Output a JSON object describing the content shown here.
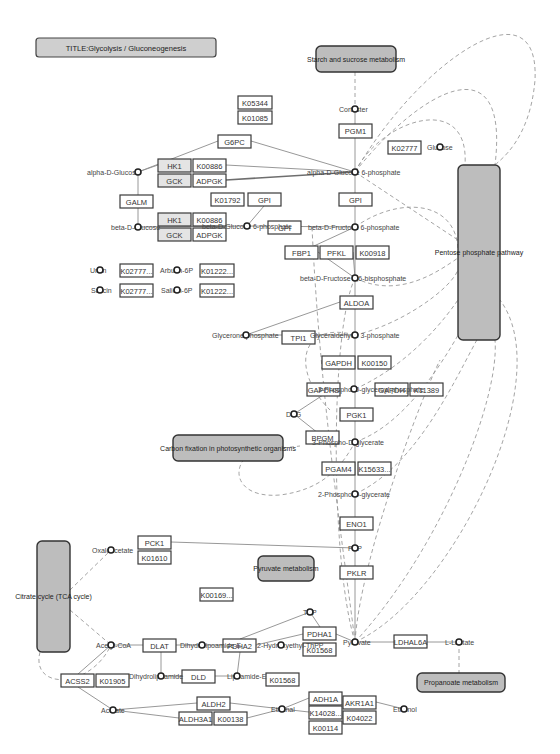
{
  "title": "TITLE:Glycolysis / Gluconeogenesis",
  "colors": {
    "map_fill": "#bdbdbd",
    "gene_border": "#3a3a3a",
    "edge": "#8c8c8c",
    "dashed": "#9a9a9a"
  },
  "maps": [
    {
      "id": "starch",
      "label": "Starch and sucrose metabolism",
      "x": 316,
      "y": 46,
      "w": 80,
      "h": 26
    },
    {
      "id": "ppp",
      "label": "Pentose phosphate pathway",
      "x": 458,
      "y": 165,
      "w": 42,
      "h": 175
    },
    {
      "id": "carbon",
      "label": "Carbon fixation in photosynthetic organisms",
      "x": 173,
      "y": 435,
      "w": 110,
      "h": 26
    },
    {
      "id": "pyruvate",
      "label": "Pyruvate metabolism",
      "x": 258,
      "y": 556,
      "w": 56,
      "h": 25
    },
    {
      "id": "tca",
      "label": "Citrate cycle (TCA cycle)",
      "x": 37,
      "y": 541,
      "w": 33,
      "h": 111
    },
    {
      "id": "propanoate",
      "label": "Propanoate metabolism",
      "x": 417,
      "y": 673,
      "w": 88,
      "h": 19
    }
  ],
  "genes": [
    {
      "label": "K05344",
      "x": 238,
      "y": 96,
      "w": 34,
      "h": 13
    },
    {
      "label": "K01085",
      "x": 238,
      "y": 111,
      "w": 34,
      "h": 13
    },
    {
      "label": "PGM1",
      "x": 339,
      "y": 124,
      "w": 33,
      "h": 14
    },
    {
      "label": "K02777",
      "x": 388,
      "y": 141,
      "w": 33,
      "h": 13
    },
    {
      "label": "G6PC",
      "x": 218,
      "y": 135,
      "w": 33,
      "h": 13
    },
    {
      "label": "HK1",
      "x": 158,
      "y": 159,
      "w": 33,
      "h": 13,
      "grey": true
    },
    {
      "label": "K00886",
      "x": 193,
      "y": 159,
      "w": 33,
      "h": 13
    },
    {
      "label": "GCK",
      "x": 158,
      "y": 174,
      "w": 33,
      "h": 13,
      "grey": true
    },
    {
      "label": "ADPGK",
      "x": 193,
      "y": 174,
      "w": 33,
      "h": 13
    },
    {
      "label": "GALM",
      "x": 120,
      "y": 195,
      "w": 33,
      "h": 13
    },
    {
      "label": "K01792",
      "x": 211,
      "y": 193,
      "w": 33,
      "h": 13
    },
    {
      "label": "GPI",
      "x": 248,
      "y": 193,
      "w": 33,
      "h": 13
    },
    {
      "label": "GPI",
      "x": 339,
      "y": 193,
      "w": 33,
      "h": 13
    },
    {
      "label": "HK1",
      "x": 158,
      "y": 213,
      "w": 33,
      "h": 13,
      "grey": true
    },
    {
      "label": "K00886",
      "x": 193,
      "y": 213,
      "w": 33,
      "h": 13
    },
    {
      "label": "GCK",
      "x": 158,
      "y": 228,
      "w": 33,
      "h": 13,
      "grey": true
    },
    {
      "label": "ADPGK",
      "x": 193,
      "y": 228,
      "w": 33,
      "h": 13
    },
    {
      "label": "GPI",
      "x": 268,
      "y": 221,
      "w": 33,
      "h": 13
    },
    {
      "label": "FBP1",
      "x": 285,
      "y": 246,
      "w": 33,
      "h": 13
    },
    {
      "label": "PFKL",
      "x": 320,
      "y": 246,
      "w": 33,
      "h": 13
    },
    {
      "label": "K00918",
      "x": 356,
      "y": 246,
      "w": 33,
      "h": 13
    },
    {
      "label": "K02777...",
      "x": 120,
      "y": 264,
      "w": 33,
      "h": 13
    },
    {
      "label": "K01222...",
      "x": 200,
      "y": 264,
      "w": 34,
      "h": 13
    },
    {
      "label": "K02777...",
      "x": 120,
      "y": 284,
      "w": 33,
      "h": 13
    },
    {
      "label": "K01222...",
      "x": 200,
      "y": 284,
      "w": 34,
      "h": 13
    },
    {
      "label": "ALDOA",
      "x": 340,
      "y": 296,
      "w": 33,
      "h": 13
    },
    {
      "label": "TPI1",
      "x": 282,
      "y": 331,
      "w": 33,
      "h": 13
    },
    {
      "label": "GAPDH",
      "x": 322,
      "y": 356,
      "w": 33,
      "h": 13
    },
    {
      "label": "K00150",
      "x": 358,
      "y": 356,
      "w": 33,
      "h": 13
    },
    {
      "label": "GAPDHS",
      "x": 307,
      "y": 383,
      "w": 33,
      "h": 13
    },
    {
      "label": "GAPDH",
      "x": 375,
      "y": 383,
      "w": 33,
      "h": 13
    },
    {
      "label": "K11389",
      "x": 410,
      "y": 383,
      "w": 33,
      "h": 13
    },
    {
      "label": "PGK1",
      "x": 340,
      "y": 408,
      "w": 33,
      "h": 13
    },
    {
      "label": "BPGM",
      "x": 306,
      "y": 431,
      "w": 33,
      "h": 13
    },
    {
      "label": "PGAM4",
      "x": 322,
      "y": 462,
      "w": 33,
      "h": 13
    },
    {
      "label": "K15633...",
      "x": 358,
      "y": 462,
      "w": 33,
      "h": 13
    },
    {
      "label": "ENO1",
      "x": 340,
      "y": 517,
      "w": 33,
      "h": 13
    },
    {
      "label": "PCK1",
      "x": 138,
      "y": 536,
      "w": 33,
      "h": 13
    },
    {
      "label": "K01610",
      "x": 138,
      "y": 551,
      "w": 33,
      "h": 13
    },
    {
      "label": "PKLR",
      "x": 340,
      "y": 566,
      "w": 33,
      "h": 13
    },
    {
      "label": "K00169...",
      "x": 200,
      "y": 588,
      "w": 33,
      "h": 13
    },
    {
      "label": "PDHA1",
      "x": 303,
      "y": 627,
      "w": 33,
      "h": 13
    },
    {
      "label": "K01568",
      "x": 303,
      "y": 643,
      "w": 33,
      "h": 13
    },
    {
      "label": "DLAT",
      "x": 143,
      "y": 639,
      "w": 33,
      "h": 13
    },
    {
      "label": "PDHA2",
      "x": 223,
      "y": 639,
      "w": 33,
      "h": 13
    },
    {
      "label": "LDHAL6A",
      "x": 394,
      "y": 635,
      "w": 33,
      "h": 13
    },
    {
      "label": "DLD",
      "x": 182,
      "y": 670,
      "w": 33,
      "h": 13
    },
    {
      "label": "ACSS2",
      "x": 61,
      "y": 674,
      "w": 33,
      "h": 13
    },
    {
      "label": "K01905",
      "x": 96,
      "y": 674,
      "w": 33,
      "h": 13
    },
    {
      "label": "K01568",
      "x": 266,
      "y": 673,
      "w": 33,
      "h": 13
    },
    {
      "label": "ADH1A",
      "x": 309,
      "y": 692,
      "w": 33,
      "h": 13
    },
    {
      "label": "K14028...",
      "x": 309,
      "y": 706,
      "w": 33,
      "h": 13
    },
    {
      "label": "K00114",
      "x": 309,
      "y": 721,
      "w": 33,
      "h": 13
    },
    {
      "label": "AKR1A1",
      "x": 343,
      "y": 696,
      "w": 33,
      "h": 13
    },
    {
      "label": "K04022",
      "x": 343,
      "y": 711,
      "w": 33,
      "h": 13
    },
    {
      "label": "ALDH2",
      "x": 197,
      "y": 697,
      "w": 33,
      "h": 13
    },
    {
      "label": "ALDH3A1",
      "x": 179,
      "y": 712,
      "w": 33,
      "h": 13
    },
    {
      "label": "K00138",
      "x": 214,
      "y": 712,
      "w": 33,
      "h": 13
    }
  ],
  "compounds": [
    {
      "label": "Cortester",
      "x": 355,
      "y": 109,
      "lx": 339
    },
    {
      "label": "Glucose",
      "x": 440,
      "y": 147,
      "lx": 427
    },
    {
      "label": "alpha-D-Glucose",
      "x": 138,
      "y": 172,
      "lx": 87
    },
    {
      "label": "alpha-D-Glucose 6-phosphate",
      "x": 355,
      "y": 172,
      "lx": 307
    },
    {
      "label": "beta-D-Glucose",
      "x": 138,
      "y": 227,
      "lx": 111
    },
    {
      "label": "beta-D-Glucose 6-phosphate",
      "x": 247,
      "y": 226,
      "lx": 202
    },
    {
      "label": "beta-D-Fructose 6-phosphate",
      "x": 355,
      "y": 227,
      "lx": 308
    },
    {
      "label": "beta-D-Fructose 1,6-bisphosphate",
      "x": 355,
      "y": 278,
      "lx": 300
    },
    {
      "label": "Ursin",
      "x": 100,
      "y": 270,
      "lx": 90
    },
    {
      "label": "Arbutin-6P",
      "x": 177,
      "y": 270,
      "lx": 160
    },
    {
      "label": "Salicin",
      "x": 100,
      "y": 290,
      "lx": 91
    },
    {
      "label": "Salicin-6P",
      "x": 177,
      "y": 290,
      "lx": 161
    },
    {
      "label": "Glycerone phosphate",
      "x": 246,
      "y": 335,
      "lx": 212
    },
    {
      "label": "Glyceraldehyde 3-phosphate",
      "x": 355,
      "y": 335,
      "lx": 310
    },
    {
      "label": "3-Phospho-D-glyceroyl phosphate",
      "x": 354,
      "y": 389,
      "lx": 318
    },
    {
      "label": "DPG",
      "x": 294,
      "y": 414,
      "lx": 286
    },
    {
      "label": "3-Phospho-D-glycerate",
      "x": 355,
      "y": 442,
      "lx": 312
    },
    {
      "label": "2-Phospho-D-glycerate",
      "x": 355,
      "y": 494,
      "lx": 318
    },
    {
      "label": "PEP",
      "x": 355,
      "y": 548,
      "lx": 348
    },
    {
      "label": "Oxaloacetate",
      "x": 111,
      "y": 550,
      "lx": 92
    },
    {
      "label": "TPP",
      "x": 310,
      "y": 612,
      "lx": 303
    },
    {
      "label": "Acetyl-CoA",
      "x": 111,
      "y": 645,
      "lx": 96
    },
    {
      "label": "Dihydrolipoamide-E",
      "x": 202,
      "y": 645,
      "lx": 180
    },
    {
      "label": "2-Hydroxyethyl-ThPP",
      "x": 281,
      "y": 645,
      "lx": 257
    },
    {
      "label": "Pyruvate",
      "x": 355,
      "y": 642,
      "lx": 343
    },
    {
      "label": "L-Lactate",
      "x": 459,
      "y": 642,
      "lx": 445
    },
    {
      "label": "Dihydrolipoamide",
      "x": 161,
      "y": 676,
      "lx": 129
    },
    {
      "label": "Lipoamide-E",
      "x": 237,
      "y": 676,
      "lx": 227
    },
    {
      "label": "Acetate",
      "x": 113,
      "y": 710,
      "lx": 101
    },
    {
      "label": "Ethanal",
      "x": 282,
      "y": 709,
      "lx": 271
    },
    {
      "label": "Ethanol",
      "x": 404,
      "y": 709,
      "lx": 393
    }
  ]
}
